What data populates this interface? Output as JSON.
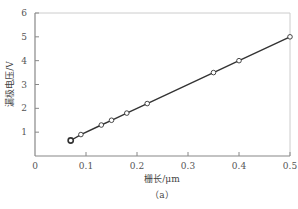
{
  "chart_data": {
    "type": "line",
    "title": "",
    "caption": "（a）",
    "xlabel": "栅长/μm",
    "ylabel": "漏极电压/V",
    "xlim": [
      0,
      0.5
    ],
    "ylim": [
      0,
      6
    ],
    "xticks": [
      "0",
      "0.1",
      "0.2",
      "0.3",
      "0.4",
      "0.5"
    ],
    "yticks": [
      "1",
      "2",
      "3",
      "4",
      "5",
      "6"
    ],
    "grid": false,
    "legend": null,
    "series": [
      {
        "name": "漏极电压",
        "marker": "open-circle",
        "x": [
          0.07,
          0.09,
          0.13,
          0.15,
          0.18,
          0.22,
          0.35,
          0.4,
          0.5
        ],
        "y": [
          0.65,
          0.9,
          1.3,
          1.5,
          1.8,
          2.2,
          3.5,
          4.0,
          5.0
        ]
      }
    ]
  },
  "colors": {
    "line": "#333333",
    "axis": "#888888",
    "frame": "#cccccc",
    "marker_fill": "#ffffff"
  }
}
